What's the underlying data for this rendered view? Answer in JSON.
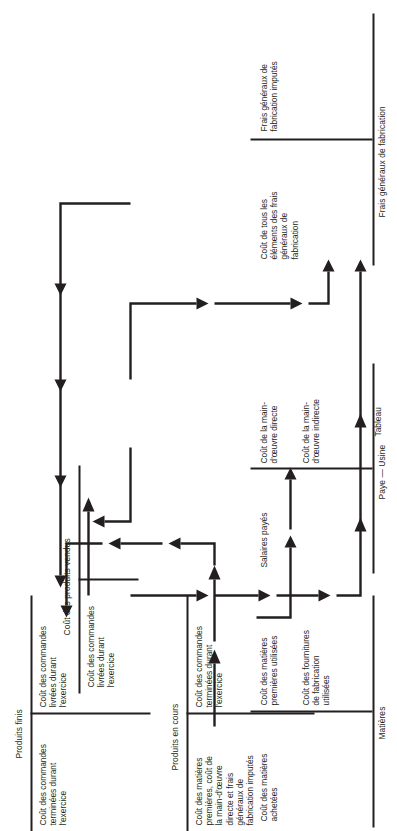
{
  "figure": {
    "caption": "Tableau",
    "language": "fr",
    "orientation": "rotated-90-ccw",
    "line_color": "#231f20",
    "background": "#ffffff"
  },
  "accounts": [
    {
      "id": "matieres",
      "title": "Matières",
      "debit": "Coût des matières\nachetées",
      "credit_1": "Coût des matières\npremières utilisées",
      "credit_2": "Coût des fournitures\nde fabrication\nutilisées"
    },
    {
      "id": "paye-usine",
      "title": "Paye — Usine",
      "debit": "Salaires payés",
      "credit_1": "Coût de la main-\nd'œuvre directe",
      "credit_2": "Coût de la main-\nd'œuvre indirecte"
    },
    {
      "id": "frais-generaux-de-fabrication",
      "title": "Frais généraux de fabrication",
      "debit": "Coût de tous les\néléments des frais\ngénéraux de\nfabrication",
      "credit_1": "Frais généraux de\nfabrication imputés"
    },
    {
      "id": "produits-en-cours",
      "title": "Produits en cours",
      "debit": "Coût des matières\npremières, coût de\nla main-d'œuvre\ndirecte et frais\ngénéraux de\nfabrication imputés",
      "credit_1": "Coût des commandes\nterminées durant\nl'exercice"
    },
    {
      "id": "produits-finis",
      "title": "Produits finis",
      "debit": "Coût des commandes\nterminées durant\nl'exercice",
      "credit_1": "Coût des commandes\nlivrées durant\nl'exercice"
    },
    {
      "id": "cout-des-produits-vendus",
      "title": "Coût des produits vendus",
      "debit": "Coût des commandes\nlivrées durant\nl'exercice"
    }
  ],
  "flows": [
    {
      "id": "flow-matieres-to-produits-en-cours",
      "from": "Matières",
      "to": "Produits en cours",
      "label": ""
    },
    {
      "id": "flow-matieres-fournitures-to-frais-generaux",
      "from": "Matières",
      "to": "Frais généraux de fabrication",
      "label": ""
    },
    {
      "id": "flow-paye-directe-to-produits-en-cours",
      "from": "Paye — Usine",
      "to": "Produits en cours",
      "label": ""
    },
    {
      "id": "flow-paye-indirecte-to-frais-generaux",
      "from": "Paye — Usine",
      "to": "Frais généraux de fabrication",
      "label": ""
    },
    {
      "id": "flow-frais-imputes-to-produits-en-cours",
      "from": "Frais généraux de fabrication",
      "to": "Produits en cours",
      "label": ""
    },
    {
      "id": "flow-produits-en-cours-to-produits-finis",
      "from": "Produits en cours",
      "to": "Produits finis",
      "label": ""
    },
    {
      "id": "flow-produits-finis-to-cout-produits-vendus",
      "from": "Produits finis",
      "to": "Coût des produits vendus",
      "label": ""
    }
  ]
}
